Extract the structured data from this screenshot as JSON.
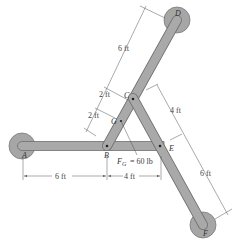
{
  "diagram": {
    "type": "frame-structure",
    "points": {
      "A": "A",
      "B": "B",
      "C": "C",
      "D": "D",
      "E": "E",
      "F": "F",
      "G": "G"
    },
    "load": {
      "label": "F",
      "subscript": "G",
      "value": "= 60 lb"
    },
    "dimensions": {
      "AB": "6 ft",
      "BE": "4 ft",
      "CD": "6 ft",
      "CG": "2 ft",
      "GB": "2 ft",
      "CE": "4 ft",
      "EF": "6 ft"
    },
    "colors": {
      "member_fill": "#a9a9a9",
      "member_stroke": "#6f6f6f",
      "dimension_line": "#555555",
      "background": "#ffffff"
    }
  }
}
